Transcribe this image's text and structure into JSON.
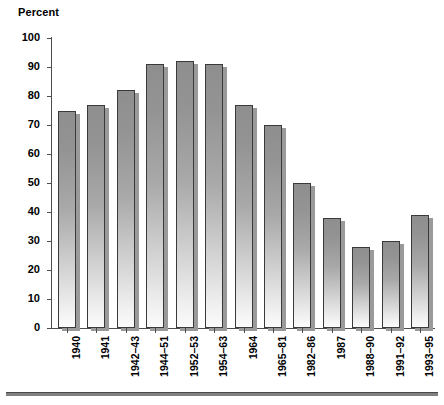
{
  "chart_data": {
    "type": "bar",
    "title": "",
    "ylabel": "Percent",
    "xlabel": "",
    "ylim": [
      0,
      100
    ],
    "ytick_step": 10,
    "yticks": [
      100,
      90,
      80,
      70,
      60,
      50,
      40,
      30,
      20,
      10,
      0
    ],
    "grid": false,
    "legend": null,
    "categories": [
      "1940",
      "1941",
      "1942–43",
      "1944–51",
      "1952–53",
      "1954–63",
      "1964",
      "1965–81",
      "1982–86",
      "1987",
      "1988–90",
      "1991–92",
      "1993–95"
    ],
    "values": [
      75,
      77,
      82,
      91,
      92,
      91,
      77,
      70,
      50,
      38,
      28,
      30,
      39
    ],
    "bar_style": {
      "fill_top": "#8e8e8e",
      "fill_bottom": "#fbfbfb",
      "outline": "#3a3a3a",
      "shadow": "#9a9a9a"
    }
  },
  "axis": {
    "percent_label": "Percent"
  }
}
